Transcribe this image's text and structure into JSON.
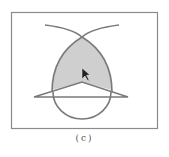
{
  "figure": {
    "caption": "(c)",
    "colors": {
      "stroke": "#7a7a7a",
      "frame": "#8a8a8a",
      "fill": "#cfcfcf",
      "cursor": "#222222"
    },
    "elements": [
      "rectangular frame",
      "two crossing arcs forming a lens (shaded)",
      "triangle with apex inside the lens and a horizontal base",
      "circle at the bottom overlapping the triangle",
      "arrow mouse cursor inside the shaded region"
    ]
  }
}
